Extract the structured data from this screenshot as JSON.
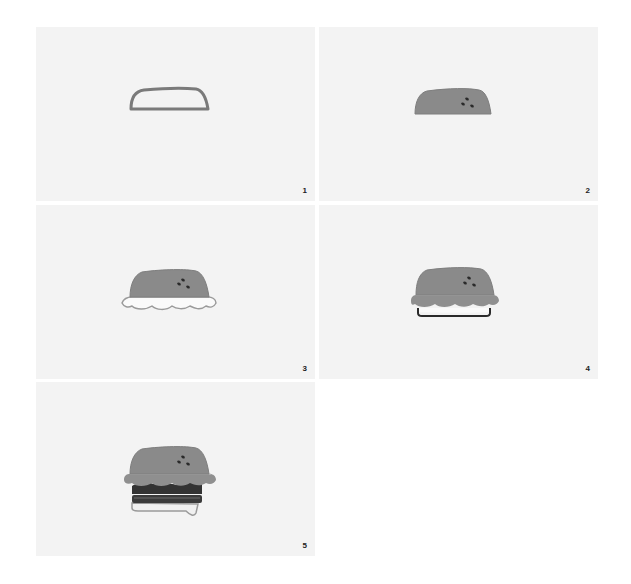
{
  "colors": {
    "panel_bg": "#f3f3f3",
    "page_bg": "#ffffff",
    "bun": "#8a8a8a",
    "bun_outline": "#7a7a7a",
    "seeds": "#2a2a2a",
    "lettuce_fill": "#fafafa",
    "lettuce_outline": "#9a9a9a",
    "patty": "#333333",
    "cheese": "#e6e6e6"
  },
  "steps": [
    {
      "number": "1",
      "description": "Top bun outline"
    },
    {
      "number": "2",
      "description": "Filled top bun with sesame seeds"
    },
    {
      "number": "3",
      "description": "Wavy lettuce under bun"
    },
    {
      "number": "4",
      "description": "Patty outline below lettuce"
    },
    {
      "number": "5",
      "description": "Complete burger with patty, cheese and bottom bun"
    }
  ]
}
